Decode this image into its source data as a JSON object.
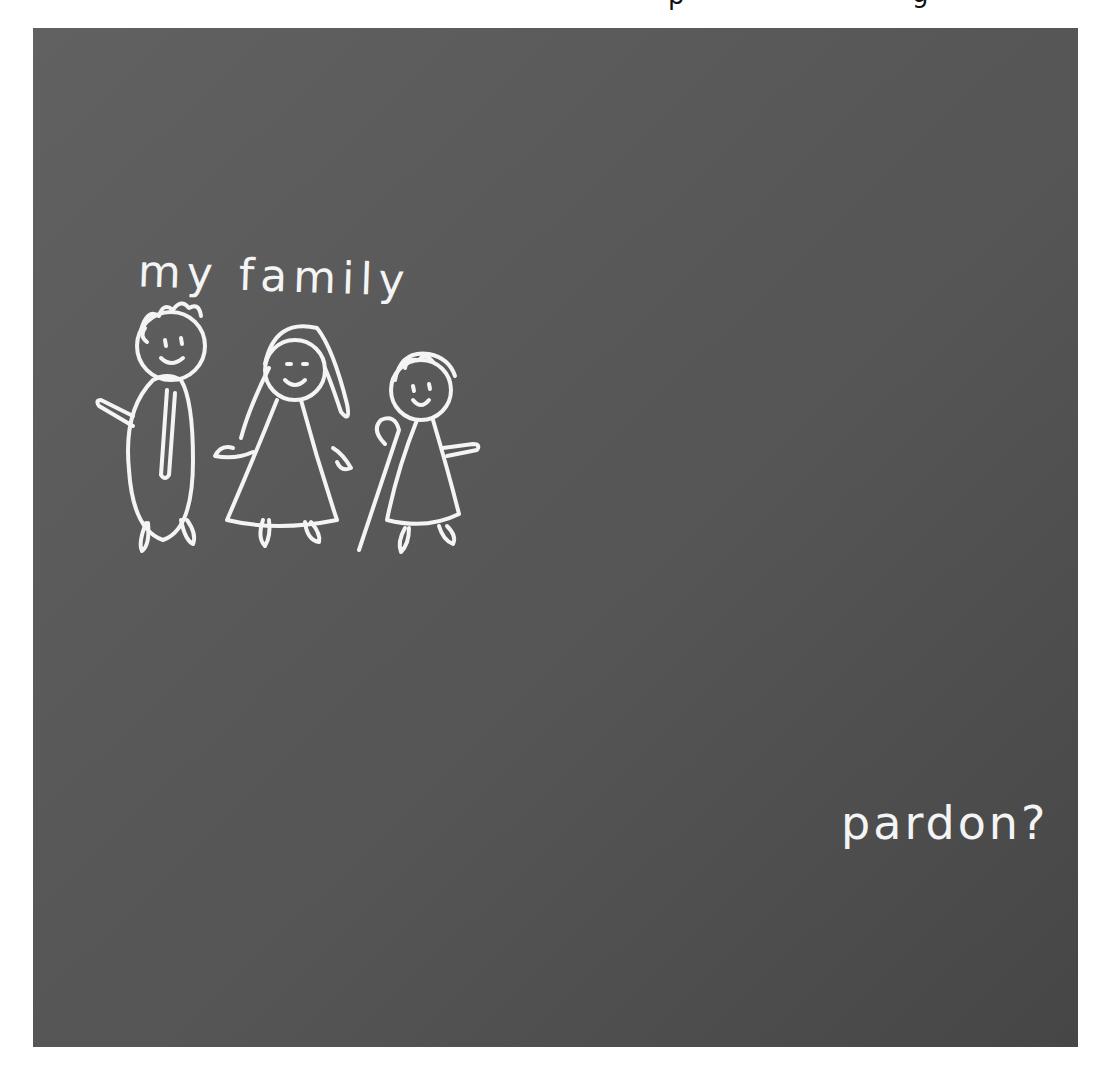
{
  "scene": {
    "title": "Chalkboard drawing",
    "board_color": "#5c5c5c",
    "board_color_dark": "#4a4a4a",
    "chalk_color": "#f4f4f4",
    "outline_color": "#111111",
    "skin_color": "#d6d6d6",
    "clothing_color": "#8c8c8c"
  },
  "top_clipped_glyphs": {
    "left": "p",
    "right": "g"
  },
  "chalk_writing": {
    "family_caption": "my family",
    "speech_text": "pardon?"
  },
  "drawings": {
    "family": [
      "father",
      "mother",
      "child with cane"
    ],
    "house": {
      "windows_left": 9,
      "windows_right": 11,
      "door": 1,
      "chimney": 1
    },
    "girl": {
      "hat": true
    },
    "cloud": 1,
    "path": "two lines leading from house"
  },
  "teacher": {
    "hair": "braid",
    "holding": "chalk",
    "pose": "arm raised pointing at board"
  }
}
